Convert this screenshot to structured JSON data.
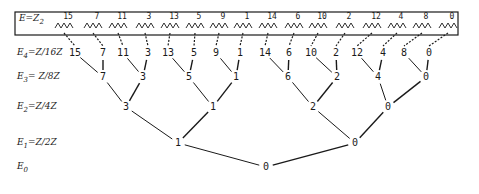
{
  "box": {
    "label": "E=Z",
    "label_sub": "2"
  },
  "levels": [
    {
      "name": "E",
      "sub": "4",
      "rest": "=Z/16Z",
      "y": 53
    },
    {
      "name": "E",
      "sub": "3",
      "rest": "= Z/8Z",
      "y": 77
    },
    {
      "name": "E",
      "sub": "2",
      "rest": "=Z/4Z",
      "y": 107
    },
    {
      "name": "E",
      "sub": "1",
      "rest": "=Z/2Z",
      "y": 143
    },
    {
      "name": "E",
      "sub": "0",
      "rest": "",
      "y": 167
    }
  ],
  "top_labels": [
    {
      "v": "15",
      "x": 64
    },
    {
      "v": "7",
      "x": 93
    },
    {
      "v": "11",
      "x": 118
    },
    {
      "v": "3",
      "x": 145
    },
    {
      "v": "13",
      "x": 170
    },
    {
      "v": "5",
      "x": 195
    },
    {
      "v": "9",
      "x": 219
    },
    {
      "v": "1",
      "x": 243
    },
    {
      "v": "14",
      "x": 268
    },
    {
      "v": "6",
      "x": 294
    },
    {
      "v": "10",
      "x": 318
    },
    {
      "v": "2",
      "x": 345
    },
    {
      "v": "12",
      "x": 372
    },
    {
      "v": "4",
      "x": 397
    },
    {
      "v": "8",
      "x": 422
    },
    {
      "v": "0",
      "x": 448
    }
  ],
  "e4": [
    {
      "v": "15",
      "x": 75
    },
    {
      "v": "7",
      "x": 103
    },
    {
      "v": "11",
      "x": 123
    },
    {
      "v": "3",
      "x": 148
    },
    {
      "v": "13",
      "x": 168
    },
    {
      "v": "5",
      "x": 194
    },
    {
      "v": "9",
      "x": 216
    },
    {
      "v": "1",
      "x": 240
    },
    {
      "v": "14",
      "x": 265
    },
    {
      "v": "6",
      "x": 289
    },
    {
      "v": "10",
      "x": 311
    },
    {
      "v": "2",
      "x": 336
    },
    {
      "v": "12",
      "x": 357
    },
    {
      "v": "4",
      "x": 383
    },
    {
      "v": "8",
      "x": 404
    },
    {
      "v": "0",
      "x": 429
    }
  ],
  "e3": [
    {
      "v": "7",
      "x": 103
    },
    {
      "v": "3",
      "x": 143
    },
    {
      "v": "5",
      "x": 189
    },
    {
      "v": "1",
      "x": 236
    },
    {
      "v": "6",
      "x": 288
    },
    {
      "v": "2",
      "x": 337
    },
    {
      "v": "4",
      "x": 378
    },
    {
      "v": "0",
      "x": 426
    }
  ],
  "e2": [
    {
      "v": "3",
      "x": 126
    },
    {
      "v": "1",
      "x": 213
    },
    {
      "v": "2",
      "x": 313
    },
    {
      "v": "0",
      "x": 388
    }
  ],
  "e1": [
    {
      "v": "1",
      "x": 178
    },
    {
      "v": "0",
      "x": 355
    }
  ],
  "e0": [
    {
      "v": "0",
      "x": 266
    }
  ]
}
